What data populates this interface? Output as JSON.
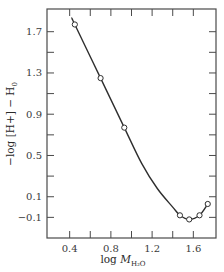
{
  "chart_data": {
    "type": "line",
    "title": "",
    "xlabel": "log M_H2O",
    "xlabel_main": "log ",
    "xlabel_var": "M",
    "xlabel_sub": "H₂O",
    "ylabel": "−log [H+] − H₀",
    "ylabel_main": "−log [H+] − H",
    "ylabel_sub": "0",
    "xlim": [
      0.18,
      1.82
    ],
    "ylim": [
      -0.3,
      1.92
    ],
    "x_ticks": [
      0.4,
      0.6,
      0.8,
      1.0,
      1.2,
      1.4,
      1.6
    ],
    "x_tick_labels": [
      {
        "value": 0.4,
        "label": "0.4"
      },
      {
        "value": 0.8,
        "label": "0.8"
      },
      {
        "value": 1.2,
        "label": "1.2"
      },
      {
        "value": 1.6,
        "label": "1.6"
      }
    ],
    "y_ticks": [
      -0.1,
      0.1,
      0.3,
      0.5,
      0.7,
      0.9,
      1.1,
      1.3,
      1.5,
      1.7
    ],
    "y_tick_labels": [
      {
        "value": 1.7,
        "label": "1.7"
      },
      {
        "value": 1.3,
        "label": "1.3"
      },
      {
        "value": 0.9,
        "label": "0.9"
      },
      {
        "value": 0.5,
        "label": "0.5"
      },
      {
        "value": 0.1,
        "label": "0.1"
      },
      {
        "value": -0.1,
        "label": "−0.1"
      }
    ],
    "grid": false,
    "legend": null,
    "series": [
      {
        "name": "measured",
        "marker": "open-circle",
        "points": [
          {
            "x": 0.45,
            "y": 1.77
          },
          {
            "x": 0.7,
            "y": 1.25
          },
          {
            "x": 0.93,
            "y": 0.77
          },
          {
            "x": 1.47,
            "y": -0.08
          },
          {
            "x": 1.56,
            "y": -0.12
          },
          {
            "x": 1.66,
            "y": -0.08
          },
          {
            "x": 1.74,
            "y": 0.03
          }
        ]
      }
    ],
    "curve": [
      {
        "x": 0.42,
        "y": 1.83
      },
      {
        "x": 0.45,
        "y": 1.77
      },
      {
        "x": 0.7,
        "y": 1.25
      },
      {
        "x": 0.93,
        "y": 0.77
      },
      {
        "x": 1.1,
        "y": 0.42
      },
      {
        "x": 1.25,
        "y": 0.18
      },
      {
        "x": 1.4,
        "y": 0.0
      },
      {
        "x": 1.47,
        "y": -0.08
      },
      {
        "x": 1.56,
        "y": -0.12
      },
      {
        "x": 1.66,
        "y": -0.08
      },
      {
        "x": 1.74,
        "y": 0.03
      }
    ]
  },
  "layout": {
    "plot": {
      "left": 47,
      "top": 9,
      "right": 216,
      "bottom": 238
    },
    "line_color": "#2e2e2e",
    "axis_color": "#4a4a4a"
  }
}
